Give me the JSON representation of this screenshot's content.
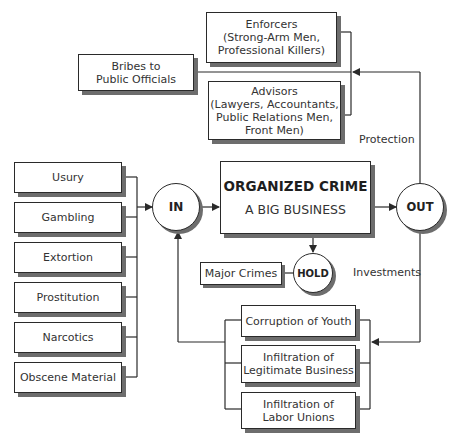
{
  "diagram": {
    "central": {
      "title": "ORGANIZED CRIME",
      "subtitle": "A BIG BUSINESS"
    },
    "nodes": {
      "in": "IN",
      "out": "OUT",
      "hold": "HOLD"
    },
    "inputs": [
      {
        "label": "Usury"
      },
      {
        "label": "Gambling"
      },
      {
        "label": "Extortion"
      },
      {
        "label": "Prostitution"
      },
      {
        "label": "Narcotics"
      },
      {
        "label": "Obscene Material"
      }
    ],
    "protection": {
      "label": "Protection",
      "enforcers": "Enforcers\n(Strong-Arm Men,\nProfessional Killers)",
      "advisors": "Advisors\n(Lawyers, Accountants,\nPublic Relations Men,\nFront Men)",
      "bribes": "Bribes to\nPublic Officials"
    },
    "hold_target": "Major Crimes",
    "investments": {
      "label": "Investments",
      "items": [
        {
          "label": "Corruption of Youth"
        },
        {
          "label": "Infiltration of\nLegitimate Business"
        },
        {
          "label": "Infiltration of\nLabor Unions"
        }
      ]
    },
    "colors": {
      "line": "#2a2a2a",
      "shadow": "#6d6d6d",
      "background": "#ffffff"
    }
  }
}
